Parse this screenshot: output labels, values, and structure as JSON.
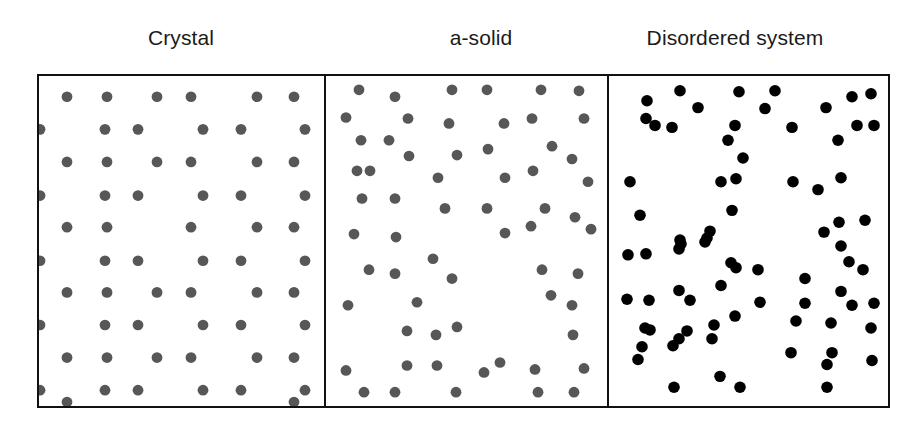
{
  "figure": {
    "title": "",
    "background_color": "#ffffff",
    "width": 921,
    "height": 424,
    "frame": {
      "x": 37,
      "y": 74,
      "width": 853,
      "height": 334,
      "border_color": "#111111",
      "border_width": 2
    }
  },
  "labels": [
    {
      "text": "Crystal",
      "center_x": 181,
      "y": 26
    },
    {
      "text": "a-solid",
      "center_x": 481,
      "y": 26
    },
    {
      "text": "Disordered system",
      "center_x": 735,
      "y": 26
    }
  ],
  "chart_data": {
    "type": "scatter",
    "title": "",
    "xlabel": "",
    "ylabel": "",
    "grid": false,
    "legend_position": "none",
    "panels": [
      {
        "name": "crystal",
        "label": "Crystal",
        "x": 0,
        "width": 285,
        "dot_color": "#575757",
        "dot_radius": 5.4,
        "order": "ordered-lattice",
        "point_count": 61,
        "xlim": [
          0,
          285
        ],
        "ylim": [
          0,
          334
        ],
        "points": [
          [
            28,
            21
          ],
          [
            68,
            21
          ],
          [
            118,
            21
          ],
          [
            152,
            21
          ],
          [
            218,
            21
          ],
          [
            255,
            21
          ],
          [
            1,
            54
          ],
          [
            66,
            54
          ],
          [
            99,
            54
          ],
          [
            164,
            54
          ],
          [
            202,
            54
          ],
          [
            266,
            54
          ],
          [
            28,
            87
          ],
          [
            68,
            87
          ],
          [
            118,
            87
          ],
          [
            152,
            87
          ],
          [
            218,
            87
          ],
          [
            255,
            87
          ],
          [
            1,
            121
          ],
          [
            66,
            121
          ],
          [
            99,
            121
          ],
          [
            164,
            121
          ],
          [
            202,
            121
          ],
          [
            266,
            121
          ],
          [
            28,
            153
          ],
          [
            68,
            153
          ],
          [
            152,
            153
          ],
          [
            218,
            153
          ],
          [
            255,
            153
          ],
          [
            1,
            187
          ],
          [
            66,
            187
          ],
          [
            99,
            187
          ],
          [
            164,
            187
          ],
          [
            202,
            187
          ],
          [
            266,
            187
          ],
          [
            28,
            219
          ],
          [
            68,
            219
          ],
          [
            118,
            219
          ],
          [
            152,
            219
          ],
          [
            218,
            219
          ],
          [
            255,
            219
          ],
          [
            1,
            252
          ],
          [
            66,
            252
          ],
          [
            99,
            252
          ],
          [
            164,
            252
          ],
          [
            202,
            252
          ],
          [
            266,
            252
          ],
          [
            28,
            285
          ],
          [
            68,
            285
          ],
          [
            118,
            285
          ],
          [
            152,
            285
          ],
          [
            218,
            285
          ],
          [
            255,
            285
          ],
          [
            1,
            318
          ],
          [
            66,
            318
          ],
          [
            99,
            318
          ],
          [
            164,
            318
          ],
          [
            202,
            318
          ],
          [
            266,
            318
          ],
          [
            28,
            330
          ],
          [
            255,
            330
          ]
        ]
      },
      {
        "name": "a-solid",
        "label": "a-solid",
        "x": 285,
        "width": 283,
        "dot_color": "#575757",
        "dot_radius": 5.4,
        "order": "distorted-lattice",
        "point_count": 62,
        "xlim": [
          0,
          283
        ],
        "ylim": [
          0,
          334
        ],
        "points": [
          [
            33,
            14
          ],
          [
            69,
            21
          ],
          [
            126,
            14
          ],
          [
            161,
            14
          ],
          [
            215,
            14
          ],
          [
            253,
            15
          ],
          [
            20,
            42
          ],
          [
            82,
            43
          ],
          [
            123,
            48
          ],
          [
            178,
            48
          ],
          [
            206,
            43
          ],
          [
            258,
            43
          ],
          [
            35,
            65
          ],
          [
            63,
            65
          ],
          [
            83,
            81
          ],
          [
            131,
            80
          ],
          [
            162,
            74
          ],
          [
            226,
            71
          ],
          [
            246,
            84
          ],
          [
            31,
            96
          ],
          [
            112,
            103
          ],
          [
            179,
            103
          ],
          [
            207,
            96
          ],
          [
            262,
            107
          ],
          [
            36,
            124
          ],
          [
            69,
            124
          ],
          [
            119,
            134
          ],
          [
            161,
            134
          ],
          [
            219,
            134
          ],
          [
            249,
            143
          ],
          [
            28,
            160
          ],
          [
            70,
            163
          ],
          [
            179,
            159
          ],
          [
            205,
            152
          ],
          [
            265,
            155
          ],
          [
            44,
            96
          ],
          [
            43,
            196
          ],
          [
            69,
            200
          ],
          [
            107,
            185
          ],
          [
            126,
            205
          ],
          [
            216,
            196
          ],
          [
            252,
            200
          ],
          [
            20,
            298
          ],
          [
            81,
            293
          ],
          [
            111,
            293
          ],
          [
            174,
            290
          ],
          [
            209,
            297
          ],
          [
            258,
            296
          ],
          [
            38,
            320
          ],
          [
            69,
            320
          ],
          [
            130,
            320
          ],
          [
            158,
            300
          ],
          [
            212,
            320
          ],
          [
            248,
            320
          ],
          [
            22,
            232
          ],
          [
            91,
            229
          ],
          [
            225,
            222
          ],
          [
            246,
            232
          ],
          [
            131,
            254
          ],
          [
            81,
            258
          ],
          [
            110,
            262
          ],
          [
            247,
            262
          ]
        ]
      },
      {
        "name": "disordered-system",
        "label": "Disordered system",
        "x": 568,
        "width": 285,
        "dot_color": "#000000",
        "dot_radius": 5.8,
        "order": "random",
        "point_count": 75,
        "xlim": [
          0,
          285
        ],
        "ylim": [
          0,
          334
        ],
        "points": [
          [
            38,
            25
          ],
          [
            71,
            15
          ],
          [
            130,
            16
          ],
          [
            166,
            15
          ],
          [
            243,
            21
          ],
          [
            262,
            18
          ],
          [
            37,
            43
          ],
          [
            89,
            32
          ],
          [
            156,
            33
          ],
          [
            217,
            32
          ],
          [
            46,
            50
          ],
          [
            63,
            52
          ],
          [
            126,
            50
          ],
          [
            183,
            52
          ],
          [
            248,
            50
          ],
          [
            265,
            50
          ],
          [
            119,
            65
          ],
          [
            229,
            65
          ],
          [
            134,
            83
          ],
          [
            21,
            107
          ],
          [
            112,
            107
          ],
          [
            127,
            104
          ],
          [
            184,
            107
          ],
          [
            232,
            103
          ],
          [
            209,
            115
          ],
          [
            31,
            141
          ],
          [
            123,
            136
          ],
          [
            101,
            157
          ],
          [
            230,
            148
          ],
          [
            256,
            146
          ],
          [
            71,
            166
          ],
          [
            215,
            158
          ],
          [
            96,
            168
          ],
          [
            37,
            180
          ],
          [
            98,
            164
          ],
          [
            72,
            170
          ],
          [
            70,
            175
          ],
          [
            232,
            172
          ],
          [
            41,
            257
          ],
          [
            105,
            252
          ],
          [
            222,
            250
          ],
          [
            262,
            255
          ],
          [
            36,
            255
          ],
          [
            78,
            258
          ],
          [
            19,
            181
          ],
          [
            240,
            188
          ],
          [
            122,
            189
          ],
          [
            127,
            194
          ],
          [
            70,
            217
          ],
          [
            81,
            227
          ],
          [
            112,
            212
          ],
          [
            232,
            218
          ],
          [
            243,
            232
          ],
          [
            18,
            226
          ],
          [
            40,
            227
          ],
          [
            151,
            229
          ],
          [
            196,
            230
          ],
          [
            265,
            230
          ],
          [
            126,
            243
          ],
          [
            187,
            248
          ],
          [
            70,
            266
          ],
          [
            64,
            273
          ],
          [
            103,
            266
          ],
          [
            33,
            274
          ],
          [
            29,
            287
          ],
          [
            182,
            280
          ],
          [
            223,
            280
          ],
          [
            218,
            292
          ],
          [
            263,
            288
          ],
          [
            111,
            304
          ],
          [
            65,
            315
          ],
          [
            131,
            315
          ],
          [
            218,
            315
          ],
          [
            149,
            196
          ],
          [
            254,
            196
          ],
          [
            196,
            205
          ]
        ]
      }
    ]
  }
}
